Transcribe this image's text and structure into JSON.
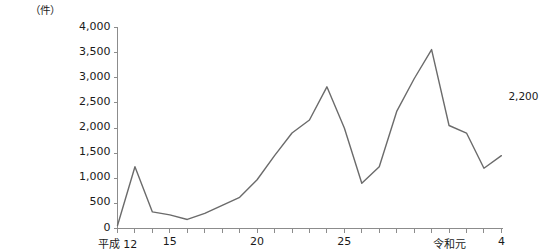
{
  "chart_data": {
    "type": "line",
    "title": "",
    "subtitle": "",
    "unit_label": "（件）",
    "xlabel": "",
    "ylabel": "",
    "ylim": [
      0,
      4000
    ],
    "ytick_labels": [
      "4,000",
      "3,500",
      "3,000",
      "2,500",
      "2,000",
      "1,500",
      "1,000",
      "500",
      "0"
    ],
    "ytick_values": [
      4000,
      3500,
      3000,
      2500,
      2000,
      1500,
      1000,
      500,
      0
    ],
    "grid": false,
    "legend": "none",
    "xtick_labels": [
      {
        "index": 0,
        "label": "平成 12"
      },
      {
        "index": 3,
        "label": "15"
      },
      {
        "index": 8,
        "label": "20"
      },
      {
        "index": 13,
        "label": "25"
      },
      {
        "index": 19,
        "label": "令和元"
      },
      {
        "index": 22,
        "label": "4"
      }
    ],
    "categories": [
      "平成12",
      "13",
      "14",
      "15",
      "16",
      "17",
      "18",
      "19",
      "20",
      "21",
      "22",
      "23",
      "24",
      "25",
      "26",
      "27",
      "28",
      "29",
      "30",
      "令和元",
      "2",
      "3",
      "4"
    ],
    "values": [
      60,
      1230,
      330,
      270,
      180,
      300,
      460,
      620,
      970,
      1450,
      1900,
      2160,
      2820,
      2000,
      900,
      1230,
      2330,
      2980,
      3560,
      2050,
      1900,
      1200,
      1450
    ],
    "series": [
      {
        "name": "件数",
        "values": [
          60,
          1230,
          330,
          270,
          180,
          300,
          460,
          620,
          970,
          1450,
          1900,
          2160,
          2820,
          2000,
          900,
          1230,
          2330,
          2980,
          3560,
          2050,
          1900,
          1200,
          1450
        ]
      }
    ],
    "annotations": [
      {
        "label": "2,200",
        "value": 2200,
        "position": "end"
      }
    ],
    "line_color": "#6b6b6b",
    "axis_color": "#8c8c8c",
    "text_color": "#1a1a1a"
  }
}
